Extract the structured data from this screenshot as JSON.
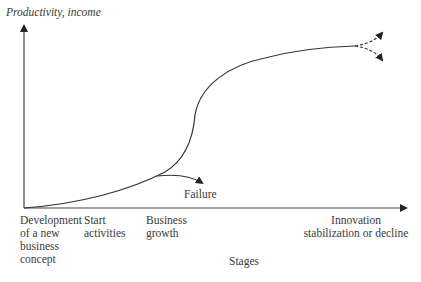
{
  "diagram": {
    "type": "life-cycle-curve",
    "y_axis_label": "Productivity, income",
    "x_axis_label": "Stages",
    "stages": [
      {
        "label": "Development\nof a new\nbusiness\nconcept"
      },
      {
        "label": "Start\nactivities"
      },
      {
        "label": "Business\ngrowth"
      },
      {
        "label": "Innovation\nstabilization or decline"
      }
    ],
    "branch_label": "Failure",
    "outcomes": [
      "growth continues (dashed up)",
      "decline (dashed down)"
    ],
    "colors": {
      "line": "#333333",
      "text": "#3a3a3a",
      "background": "#ffffff"
    }
  }
}
